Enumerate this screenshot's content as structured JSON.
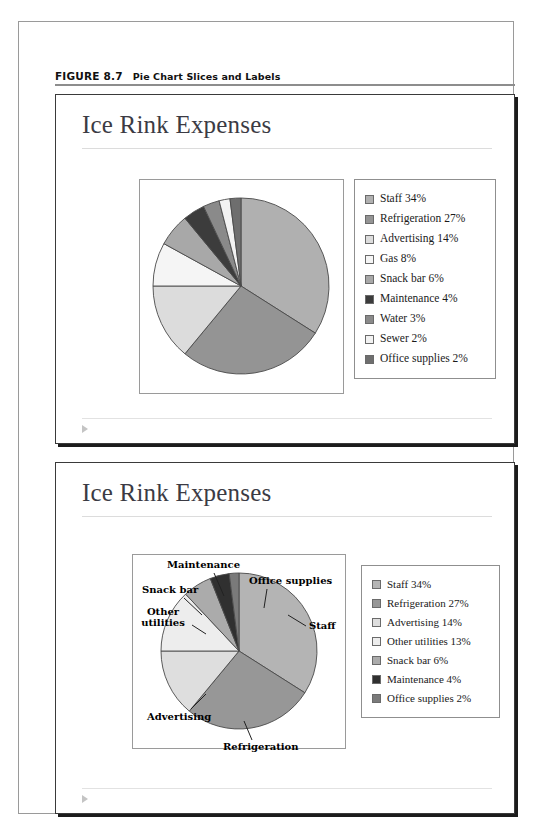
{
  "figure": {
    "number": "FIGURE 8.7",
    "title": "Pie Chart Slices and Labels"
  },
  "slides": [
    {
      "name": "slide-1",
      "title": "Ice Rink Expenses",
      "marker_icon": "play-triangle-icon"
    },
    {
      "name": "slide-2",
      "title": "Ice Rink Expenses",
      "marker_icon": "play-triangle-icon"
    }
  ],
  "chart_data": [
    {
      "type": "pie",
      "title": "Ice Rink Expenses",
      "legend_position": "right",
      "categories": [
        "Staff",
        "Refrigeration",
        "Advertising",
        "Gas",
        "Snack bar",
        "Maintenance",
        "Water",
        "Sewer",
        "Office supplies"
      ],
      "values": [
        34,
        27,
        14,
        8,
        6,
        4,
        3,
        2,
        2
      ],
      "unit": "%",
      "legend_entries": [
        {
          "label": "Staff 34%",
          "color": "#b0b0b0"
        },
        {
          "label": "Refrigeration 27%",
          "color": "#949494"
        },
        {
          "label": "Advertising 14%",
          "color": "#dcdcdc"
        },
        {
          "label": "Gas 8%",
          "color": "#f5f5f5"
        },
        {
          "label": "Snack bar 6%",
          "color": "#a8a8a8"
        },
        {
          "label": "Maintenance 4%",
          "color": "#3c3c3c"
        },
        {
          "label": "Water 3%",
          "color": "#8a8a8a"
        },
        {
          "label": "Sewer 2%",
          "color": "#f2f2f2"
        },
        {
          "label": "Office supplies 2%",
          "color": "#6e6e6e"
        }
      ]
    },
    {
      "type": "pie",
      "title": "Ice Rink Expenses",
      "legend_position": "right",
      "categories": [
        "Staff",
        "Refrigeration",
        "Advertising",
        "Other utilities",
        "Snack bar",
        "Maintenance",
        "Office supplies"
      ],
      "values": [
        34,
        27,
        14,
        13,
        6,
        4,
        2
      ],
      "unit": "%",
      "legend_entries": [
        {
          "label": "Staff 34%",
          "color": "#b4b4b4"
        },
        {
          "label": "Refrigeration 27%",
          "color": "#979797"
        },
        {
          "label": "Advertising 14%",
          "color": "#dedede"
        },
        {
          "label": "Other utilities 13%",
          "color": "#ededed"
        },
        {
          "label": "Snack bar 6%",
          "color": "#ababab"
        },
        {
          "label": "Maintenance 4%",
          "color": "#303030"
        },
        {
          "label": "Office supplies 2%",
          "color": "#7a7a7a"
        }
      ],
      "callouts": [
        {
          "name": "callout-maintenance",
          "text": "Maintenance"
        },
        {
          "name": "callout-office-supplies",
          "text": "Office supplies"
        },
        {
          "name": "callout-snack-bar",
          "text": "Snack bar"
        },
        {
          "name": "callout-other-utilities",
          "text": "Other utilities"
        },
        {
          "name": "callout-staff",
          "text": "Staff"
        },
        {
          "name": "callout-advertising",
          "text": "Advertising"
        },
        {
          "name": "callout-refrigeration",
          "text": "Refrigeration"
        }
      ]
    }
  ]
}
